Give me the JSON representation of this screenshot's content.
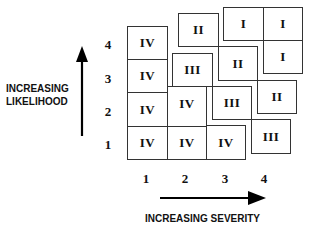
{
  "diagram": {
    "type": "risk-matrix",
    "y_axis": {
      "label_line1": "INCREASING",
      "label_line2": "LIKELIHOOD",
      "ticks": [
        "1",
        "2",
        "3",
        "4"
      ]
    },
    "x_axis": {
      "label": "INCREASING SEVERITY",
      "ticks": [
        "1",
        "2",
        "3",
        "4"
      ]
    },
    "cells": [
      {
        "severity": 1,
        "likelihood": 4,
        "category": "IV"
      },
      {
        "severity": 1,
        "likelihood": 3,
        "category": "IV"
      },
      {
        "severity": 1,
        "likelihood": 2,
        "category": "IV"
      },
      {
        "severity": 1,
        "likelihood": 1,
        "category": "IV"
      },
      {
        "severity": 2,
        "likelihood": 4,
        "category": "II"
      },
      {
        "severity": 2,
        "likelihood": 3,
        "category": "III"
      },
      {
        "severity": 2,
        "likelihood": 2,
        "category": "IV"
      },
      {
        "severity": 2,
        "likelihood": 1,
        "category": "IV"
      },
      {
        "severity": 3,
        "likelihood": 4,
        "category": "I"
      },
      {
        "severity": 3,
        "likelihood": 3,
        "category": "II"
      },
      {
        "severity": 3,
        "likelihood": 2,
        "category": "III"
      },
      {
        "severity": 3,
        "likelihood": 1,
        "category": "IV"
      },
      {
        "severity": 4,
        "likelihood": 4,
        "category": "I"
      },
      {
        "severity": 4,
        "likelihood": 3,
        "category": "I"
      },
      {
        "severity": 4,
        "likelihood": 2,
        "category": "II"
      },
      {
        "severity": 4,
        "likelihood": 1,
        "category": "III"
      }
    ]
  }
}
